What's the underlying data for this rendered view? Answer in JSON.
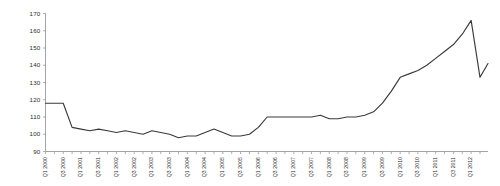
{
  "chart_data": {
    "type": "line",
    "title": "",
    "subtitle": "",
    "xlabel": "",
    "ylabel": "",
    "ylim": [
      90,
      170
    ],
    "yticks": [
      90,
      100,
      110,
      120,
      130,
      140,
      150,
      160,
      170
    ],
    "grid": false,
    "legend": false,
    "legend_position": "none",
    "line_color": "#3a3a3a",
    "axis_color": "#9a9a9a",
    "categories": [
      "Q1 2000",
      "Q2 2000",
      "Q3 2000",
      "Q4 2000",
      "Q1 2001",
      "Q2 2001",
      "Q3 2001",
      "Q4 2001",
      "Q1 2002",
      "Q2 2002",
      "Q3 2002",
      "Q4 2002",
      "Q1 2003",
      "Q2 2003",
      "Q3 2003",
      "Q4 2003",
      "Q1 2004",
      "Q2 2004",
      "Q3 2004",
      "Q4 2004",
      "Q1 2005",
      "Q2 2005",
      "Q3 2005",
      "Q4 2005",
      "Q1 2006",
      "Q2 2006",
      "Q3 2006",
      "Q4 2006",
      "Q1 2007",
      "Q2 2007",
      "Q3 2007",
      "Q4 2007",
      "Q1 2008",
      "Q2 2008",
      "Q3 2008",
      "Q4 2008",
      "Q1 2009",
      "Q2 2009",
      "Q3 2009",
      "Q4 2009",
      "Q1 2010",
      "Q2 2010",
      "Q3 2010",
      "Q4 2010",
      "Q1 2011",
      "Q2 2011",
      "Q3 2011",
      "Q4 2011",
      "Q1 2012",
      "Q2 2012"
    ],
    "values": [
      118,
      118,
      118,
      104,
      103,
      102,
      103,
      102,
      101,
      102,
      101,
      100,
      102,
      101,
      100,
      98,
      99,
      99,
      101,
      103,
      101,
      99,
      99,
      100,
      104,
      110,
      110,
      110,
      110,
      110,
      110,
      111,
      109,
      109,
      110,
      110,
      111,
      113,
      118,
      125,
      133,
      135,
      137,
      140,
      144,
      148,
      152,
      158,
      166,
      133
    ],
    "xtick_labels_displayed": [
      "Q1 2000",
      "Q3 2000",
      "Q1 2001",
      "Q3 2001",
      "Q1 2002",
      "Q3 2002",
      "Q1 2003",
      "Q3 2003",
      "Q1 2004",
      "Q3 2004",
      "Q1 2005",
      "Q3 2005",
      "Q1 2006",
      "Q3 2006",
      "Q1 2007",
      "Q3 2007",
      "Q1 2008",
      "Q3 2008",
      "Q1 2009",
      "Q3 2009",
      "Q1 2010",
      "Q3 2010",
      "Q1 2011",
      "Q3 2011",
      "Q1 2012"
    ],
    "final_value": 141
  }
}
